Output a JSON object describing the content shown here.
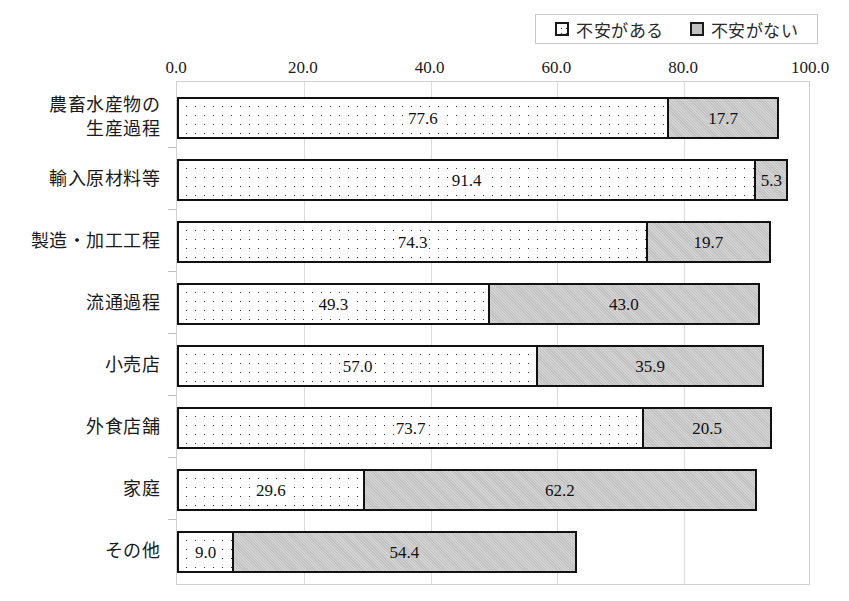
{
  "legend": {
    "box_name": "chart-legend",
    "items": [
      {
        "label": "不安がある",
        "swatch": "dotted-white-square-icon",
        "color": "#ffffff"
      },
      {
        "label": "不安がない",
        "swatch": "gray-square-icon",
        "color": "#c2c2c2"
      }
    ]
  },
  "axis": {
    "x_ticks": [
      "0.0",
      "20.0",
      "40.0",
      "60.0",
      "80.0",
      "100.0"
    ]
  },
  "chart_data": {
    "type": "bar",
    "orientation": "horizontal",
    "stacked": true,
    "title": "",
    "xlabel": "",
    "ylabel": "",
    "xlim": [
      0,
      100
    ],
    "grid": true,
    "legend_position": "top-right",
    "categories": [
      "農畜水産物の\n生産過程",
      "輸入原材料等",
      "製造・加工工程",
      "流通過程",
      "小売店",
      "外食店舗",
      "家庭",
      "その他"
    ],
    "series": [
      {
        "name": "不安がある",
        "values": [
          77.6,
          91.4,
          74.3,
          49.3,
          57.0,
          73.7,
          29.6,
          9.0
        ],
        "labels": [
          "77.6",
          "91.4",
          "74.3",
          "49.3",
          "57.0",
          "73.7",
          "29.6",
          "9.0"
        ],
        "fill": "dotted",
        "color": "#ffffff"
      },
      {
        "name": "不安がない",
        "values": [
          17.7,
          5.3,
          19.7,
          43.0,
          35.9,
          20.5,
          62.2,
          54.4
        ],
        "labels": [
          "17.7",
          "5.3",
          "19.7",
          "43.0",
          "35.9",
          "20.5",
          "62.2",
          "54.4"
        ],
        "fill": "solid",
        "color": "#c2c2c2"
      }
    ]
  }
}
